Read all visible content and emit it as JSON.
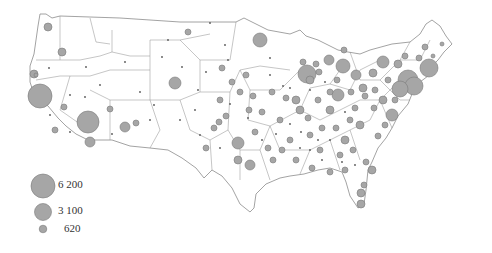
{
  "map": {
    "type": "proportional-symbol",
    "region": "Contiguous United States",
    "colors": {
      "circle_fill": "#a6a6a6",
      "circle_stroke": "#7a7a7a",
      "boundary": "#8c8c8c",
      "land": "#ffffff"
    }
  },
  "legend": {
    "items": [
      {
        "label": "6 200",
        "r": 12
      },
      {
        "label": "3 100",
        "r": 8.5
      },
      {
        "label": "620",
        "r": 3.8
      }
    ]
  },
  "circles": [
    [
      40,
      96,
      12
    ],
    [
      88,
      122,
      11
    ],
    [
      260,
      40,
      7
    ],
    [
      307,
      74,
      9
    ],
    [
      429,
      68,
      9
    ],
    [
      408,
      80,
      10
    ],
    [
      414,
      86,
      9
    ],
    [
      400,
      89,
      8
    ],
    [
      343,
      66,
      7
    ],
    [
      329,
      60,
      5
    ],
    [
      356,
      75,
      5
    ],
    [
      383,
      62,
      6
    ],
    [
      338,
      95,
      6
    ],
    [
      238,
      143,
      6
    ],
    [
      250,
      165,
      5
    ],
    [
      238,
      160,
      4
    ],
    [
      90,
      142,
      5
    ],
    [
      125,
      127,
      5
    ],
    [
      175,
      83,
      6
    ],
    [
      62,
      52,
      4
    ],
    [
      48,
      27,
      4
    ],
    [
      34,
      74,
      4
    ],
    [
      36,
      75,
      2
    ],
    [
      392,
      115,
      6
    ],
    [
      360,
      125,
      4
    ],
    [
      330,
      110,
      4
    ],
    [
      345,
      140,
      4
    ],
    [
      300,
      110,
      4
    ],
    [
      310,
      80,
      4
    ],
    [
      296,
      100,
      4
    ],
    [
      232,
      82,
      3
    ],
    [
      220,
      100,
      3
    ],
    [
      255,
      132,
      3
    ],
    [
      280,
      120,
      3
    ],
    [
      290,
      140,
      3
    ],
    [
      320,
      150,
      3
    ],
    [
      355,
      108,
      3
    ],
    [
      363,
      88,
      4
    ],
    [
      373,
      73,
      4
    ],
    [
      398,
      64,
      4
    ],
    [
      405,
      56,
      3
    ],
    [
      383,
      100,
      4
    ],
    [
      378,
      136,
      3
    ],
    [
      372,
      170,
      4
    ],
    [
      366,
      162,
      3
    ],
    [
      364,
      185,
      3
    ],
    [
      361,
      193,
      4
    ],
    [
      361,
      204,
      4
    ],
    [
      188,
      32,
      3
    ],
    [
      110,
      109,
      3
    ],
    [
      136,
      123,
      3
    ],
    [
      55,
      130,
      3
    ],
    [
      64,
      107,
      3
    ],
    [
      253,
      96,
      3
    ],
    [
      262,
      112,
      3
    ],
    [
      249,
      110,
      3
    ],
    [
      222,
      68,
      3
    ],
    [
      303,
      62,
      3
    ],
    [
      316,
      64,
      3
    ],
    [
      319,
      72,
      3
    ],
    [
      337,
      80,
      3
    ],
    [
      351,
      92,
      3
    ],
    [
      365,
      96,
      3
    ],
    [
      375,
      90,
      3
    ],
    [
      374,
      108,
      3
    ],
    [
      350,
      120,
      3
    ],
    [
      336,
      128,
      3
    ],
    [
      322,
      128,
      3
    ],
    [
      310,
      135,
      3
    ],
    [
      296,
      160,
      3
    ],
    [
      268,
      148,
      3
    ],
    [
      273,
      160,
      3
    ],
    [
      282,
      150,
      3
    ],
    [
      340,
      155,
      3
    ],
    [
      312,
      168,
      3
    ],
    [
      330,
      172,
      3
    ],
    [
      345,
      170,
      3
    ],
    [
      353,
      150,
      3
    ],
    [
      385,
      125,
      3
    ],
    [
      395,
      100,
      3
    ],
    [
      388,
      80,
      3
    ],
    [
      344,
      50,
      3
    ],
    [
      330,
      92,
      3
    ],
    [
      318,
      100,
      3
    ],
    [
      308,
      118,
      3
    ],
    [
      286,
      98,
      3
    ],
    [
      272,
      92,
      3
    ],
    [
      246,
      75,
      3
    ],
    [
      240,
      92,
      3
    ],
    [
      219,
      122,
      3
    ],
    [
      206,
      148,
      3
    ],
    [
      226,
      116,
      3
    ],
    [
      214,
      128,
      3
    ],
    [
      425,
      47,
      3
    ],
    [
      419,
      58,
      3
    ],
    [
      433,
      56,
      2
    ],
    [
      442,
      44,
      2
    ]
  ],
  "dots": [
    [
      86,
      67
    ],
    [
      49,
      68
    ],
    [
      70,
      95
    ],
    [
      125,
      62
    ],
    [
      162,
      57
    ],
    [
      168,
      40
    ],
    [
      210,
      23
    ],
    [
      182,
      67
    ],
    [
      154,
      105
    ],
    [
      150,
      120
    ],
    [
      195,
      110
    ],
    [
      140,
      92
    ],
    [
      100,
      85
    ],
    [
      85,
      97
    ],
    [
      112,
      134
    ],
    [
      70,
      132
    ],
    [
      50,
      115
    ],
    [
      225,
      45
    ],
    [
      228,
      60
    ],
    [
      270,
      58
    ],
    [
      283,
      86
    ],
    [
      290,
      124
    ],
    [
      198,
      90
    ],
    [
      206,
      72
    ],
    [
      270,
      75
    ],
    [
      262,
      140
    ],
    [
      248,
      118
    ],
    [
      230,
      104
    ],
    [
      220,
      148
    ],
    [
      200,
      135
    ],
    [
      180,
      120
    ],
    [
      276,
      134
    ],
    [
      301,
      132
    ],
    [
      318,
      140
    ],
    [
      330,
      140
    ],
    [
      345,
      112
    ],
    [
      310,
      150
    ],
    [
      322,
      160
    ],
    [
      342,
      162
    ],
    [
      355,
      165
    ],
    [
      300,
      148
    ],
    [
      290,
      88
    ],
    [
      310,
      90
    ],
    [
      325,
      82
    ]
  ]
}
